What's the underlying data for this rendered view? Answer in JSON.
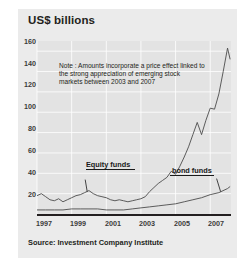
{
  "figure": {
    "title": "US$ billions",
    "source": "Source: Investment Company Institute",
    "credit": "Sciences Po / CERI et Atelier de cartographie, march 2008",
    "note": "Note : Amounts incorporate a price effect linked to the strong appreciation of emerging stock markets between 2003 and 2007",
    "panel_bg": "#ebebeb",
    "plot_bg": "#e3e3e3",
    "axis_color": "#231f20",
    "grid_color": "#ffffff",
    "line_color": "#4c4c4c"
  },
  "chart_data": {
    "type": "line",
    "title": "US$ billions",
    "xlabel": "",
    "ylabel": "US$ billions",
    "ylim": [
      0,
      170
    ],
    "xlim": [
      1997,
      2008.2
    ],
    "grid": true,
    "legend": "inline-annotations",
    "yticks": [
      20,
      40,
      60,
      80,
      100,
      120,
      140,
      160
    ],
    "xticks": [
      1997,
      1999,
      2001,
      2003,
      2005,
      2007
    ],
    "annotations": [
      "Note : Amounts incorporate a price effect linked to the strong appreciation of emerging stock markets between 2003 and 2007"
    ],
    "series": [
      {
        "name": "Equity funds",
        "x": [
          1997.0,
          1997.25,
          1997.5,
          1997.75,
          1998.0,
          1998.25,
          1998.5,
          1998.75,
          1999.0,
          1999.25,
          1999.5,
          1999.75,
          2000.0,
          2000.25,
          2000.5,
          2000.75,
          2001.0,
          2001.25,
          2001.5,
          2001.75,
          2002.0,
          2002.25,
          2002.5,
          2002.75,
          2003.0,
          2003.25,
          2003.5,
          2003.75,
          2004.0,
          2004.25,
          2004.5,
          2004.75,
          2005.0,
          2005.25,
          2005.5,
          2005.75,
          2006.0,
          2006.25,
          2006.5,
          2006.75,
          2007.0,
          2007.25,
          2007.5,
          2007.75,
          2008.0,
          2008.15
        ],
        "values": [
          18,
          20,
          17,
          14,
          13,
          15,
          12,
          14,
          16,
          18,
          19,
          21,
          23,
          20,
          18,
          17,
          16,
          14,
          13,
          14,
          13,
          12,
          13,
          14,
          15,
          17,
          22,
          26,
          30,
          33,
          36,
          42,
          39,
          47,
          56,
          66,
          78,
          90,
          78,
          92,
          104,
          103,
          118,
          140,
          163,
          152
        ]
      },
      {
        "name": "bond funds",
        "x": [
          1997.0,
          1997.5,
          1998.0,
          1998.5,
          1999.0,
          1999.5,
          2000.0,
          2000.5,
          2001.0,
          2001.5,
          2002.0,
          2002.5,
          2003.0,
          2003.5,
          2004.0,
          2004.5,
          2005.0,
          2005.5,
          2006.0,
          2006.5,
          2007.0,
          2007.5,
          2008.0,
          2008.15
        ],
        "values": [
          4,
          4,
          4,
          4,
          5,
          5,
          5,
          5,
          4,
          4,
          4,
          5,
          6,
          7,
          8,
          9,
          10,
          12,
          14,
          16,
          19,
          21,
          25,
          27
        ]
      }
    ],
    "series_labels": [
      {
        "text": "Equity funds",
        "points_to": "Equity funds"
      },
      {
        "text": "bond funds",
        "points_to": "bond funds"
      }
    ]
  },
  "yticks": {
    "t20": "20",
    "t40": "40",
    "t60": "60",
    "t80": "80",
    "t100": "100",
    "t120": "120",
    "t140": "140",
    "t160": "160"
  },
  "xticks": {
    "x1997": "1997",
    "x1999": "1999",
    "x2001": "2001",
    "x2003": "2003",
    "x2005": "2005",
    "x2007": "2007"
  },
  "labels": {
    "equity": "Equity funds",
    "bond": "bond funds"
  }
}
